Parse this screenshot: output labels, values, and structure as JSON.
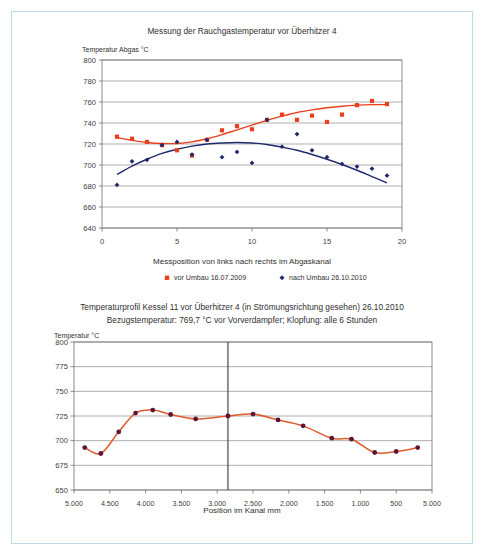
{
  "document": {
    "border_color": "#bcd9e6",
    "background": "#ffffff"
  },
  "upper": {
    "title": "Messung der Rauchgastemperatur vor Überhitzer 4",
    "y_axis_caption": "Temperatur Abgas °C",
    "x_axis_title": "Messposition von links nach rechts im Abgaskanal",
    "y_ticks": [
      "800",
      "780",
      "760",
      "740",
      "720",
      "700",
      "680",
      "660",
      "640"
    ],
    "x_ticks": [
      "0",
      "5",
      "10",
      "15",
      "20"
    ],
    "legend": [
      {
        "label": "vor Umbau 16.07.2009",
        "color": "#e8401c",
        "marker": "square"
      },
      {
        "label": "nach Umbau 26.10.2010",
        "color": "#1f2a6e",
        "marker": "diamond"
      }
    ]
  },
  "lower": {
    "title_line1": "Temperaturprofil Kessel 11 vor Überhitzer 4 (in Strömungsrichtung gesehen) 26.10.2010",
    "title_line2": "Bezugstemperatur: 769,7 °C vor Vorverdampfer; Klopfung: alle 6 Stunden",
    "y_axis_caption": "Temperatur °C",
    "x_axis_title": "Position im Kanal mm",
    "y_ticks": [
      "800",
      "775",
      "750",
      "725",
      "700",
      "675",
      "650"
    ],
    "x_ticks": [
      "5.000",
      "4.500",
      "4.000",
      "3.500",
      "3.000",
      "2.500",
      "2.000",
      "1.500",
      "1.000",
      "500",
      "5.000"
    ],
    "series_color": "#e05a2b",
    "marker_color": "#5e1436"
  },
  "chart_data": [
    {
      "id": "upper",
      "type": "scatter",
      "title": "Messung der Rauchgastemperatur vor Überhitzer 4",
      "xlabel": "Messposition von links nach rechts im Abgaskanal",
      "ylabel": "Temperatur Abgas °C",
      "xlim": [
        0,
        20
      ],
      "ylim": [
        640,
        800
      ],
      "xticks": [
        0,
        5,
        10,
        15,
        20
      ],
      "yticks": [
        640,
        660,
        680,
        700,
        720,
        740,
        760,
        780,
        800
      ],
      "grid": "horizontal",
      "legend_position": "bottom",
      "series": [
        {
          "name": "vor Umbau 16.07.2009",
          "color": "#e8401c",
          "marker": "square",
          "x": [
            1,
            2,
            3,
            4,
            5,
            6,
            7,
            8,
            9,
            10,
            11,
            12,
            13,
            14,
            15,
            16,
            17,
            18,
            19
          ],
          "values": [
            727,
            725,
            722,
            719,
            714,
            709,
            724,
            733,
            737,
            734,
            743,
            748,
            743,
            747,
            741,
            748,
            757,
            761,
            758
          ],
          "trend": [
            726,
            723.5,
            721.5,
            720.5,
            720.5,
            722,
            725,
            729,
            733.5,
            738,
            742.5,
            746.5,
            750,
            752.5,
            754.5,
            756,
            757,
            757.5,
            757.5
          ]
        },
        {
          "name": "nach Umbau 26.10.2010",
          "color": "#1f2a6e",
          "marker": "diamond",
          "x": [
            1,
            2,
            3,
            4,
            5,
            6,
            7,
            8,
            9,
            10,
            11,
            12,
            13,
            14,
            15,
            16,
            17,
            18,
            19
          ],
          "values": [
            681,
            703.5,
            705,
            719,
            722,
            710,
            724,
            707.5,
            712.5,
            702,
            743,
            717.5,
            729.5,
            714,
            707.5,
            701,
            698.5,
            696.5,
            690
          ],
          "trend": [
            691,
            699,
            705.5,
            711,
            715,
            718,
            720,
            721,
            721.5,
            721,
            719.5,
            717,
            714,
            710,
            705.5,
            700.5,
            695,
            689,
            683
          ]
        }
      ]
    },
    {
      "id": "lower",
      "type": "line",
      "title": "Temperaturprofil Kessel 11 vor Überhitzer 4 (in Strömungsrichtung gesehen) 26.10.2010",
      "subtitle": "Bezugstemperatur: 769,7 °C vor Vorverdampfer; Klopfung: alle 6 Stunden",
      "xlabel": "Position im Kanal mm",
      "ylabel": "Temperatur °C",
      "ylim": [
        650,
        800
      ],
      "yticks": [
        650,
        675,
        700,
        725,
        750,
        775,
        800
      ],
      "xticklabels": [
        "5.000",
        "4.500",
        "4.000",
        "3.500",
        "3.000",
        "2.500",
        "2.000",
        "1.500",
        "1.000",
        "500",
        "5.000"
      ],
      "grid": "horizontal",
      "divider_at_index": 4.3,
      "series": [
        {
          "name": "Temperaturprofil",
          "color": "#e05a2b",
          "marker_color": "#5e1436",
          "x": [
            0.3,
            0.75,
            1.25,
            1.72,
            2.2,
            2.7,
            3.4,
            4.3,
            5.0,
            5.7,
            6.4,
            7.2,
            7.75,
            8.4,
            9.0,
            9.6
          ],
          "values": [
            693,
            687,
            709,
            728,
            731,
            726.5,
            722,
            725,
            727,
            721,
            715,
            702.5,
            701.5,
            688,
            689,
            693
          ]
        }
      ]
    }
  ]
}
